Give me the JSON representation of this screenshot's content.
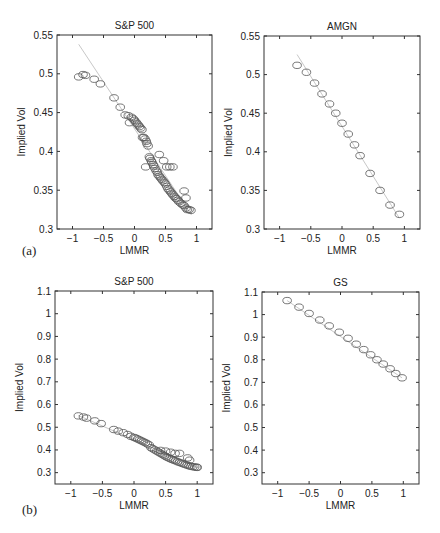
{
  "figure": {
    "panel_labels": [
      "(a)",
      "(b)"
    ]
  },
  "chart_data": [
    {
      "type": "scatter",
      "panel": "a",
      "title": "S&P 500",
      "xlabel": "LMMR",
      "ylabel": "Implied Vol",
      "xlim": [
        -1.25,
        1.25
      ],
      "ylim": [
        0.3,
        0.55
      ],
      "xticks": [
        -1,
        -0.5,
        0,
        0.5,
        1
      ],
      "xticklabels": [
        "-1",
        "-0.5",
        "0",
        "0.5",
        "1"
      ],
      "yticks": [
        0.3,
        0.35,
        0.4,
        0.45,
        0.5,
        0.55
      ],
      "yticklabels": [
        "0.3",
        "0.35",
        "0.4",
        "0.45",
        "0.5",
        "0.55"
      ],
      "grid": false,
      "fit_line": {
        "x": [
          -0.9,
          0.92
        ],
        "y": [
          0.538,
          0.318
        ]
      },
      "series": [
        {
          "name": "observed",
          "marker": "open-circle",
          "x": [
            -0.9,
            -0.83,
            -0.79,
            -0.65,
            -0.55,
            -0.33,
            -0.23,
            -0.15,
            -0.1,
            -0.08,
            -0.05,
            -0.02,
            0.0,
            0.02,
            0.04,
            0.06,
            0.08,
            0.1,
            0.12,
            0.13,
            0.15,
            0.17,
            0.19,
            0.2,
            0.22,
            0.24,
            0.25,
            0.27,
            0.28,
            0.3,
            0.31,
            0.33,
            0.35,
            0.37,
            0.38,
            0.4,
            0.42,
            0.44,
            0.46,
            0.48,
            0.5,
            0.52,
            0.54,
            0.56,
            0.58,
            0.6,
            0.62,
            0.64,
            0.66,
            0.68,
            0.7,
            0.72,
            0.75,
            0.78,
            0.8,
            0.83,
            0.85,
            0.88,
            0.91,
            0.18,
            0.4,
            0.47,
            0.52,
            0.57,
            0.62,
            0.8,
            0.83
          ],
          "y": [
            0.496,
            0.499,
            0.498,
            0.493,
            0.487,
            0.469,
            0.457,
            0.447,
            0.446,
            0.437,
            0.444,
            0.442,
            0.44,
            0.438,
            0.436,
            0.434,
            0.432,
            0.43,
            0.428,
            0.418,
            0.418,
            0.416,
            0.413,
            0.41,
            0.407,
            0.393,
            0.391,
            0.388,
            0.386,
            0.383,
            0.381,
            0.378,
            0.375,
            0.373,
            0.37,
            0.368,
            0.366,
            0.364,
            0.362,
            0.36,
            0.358,
            0.355,
            0.352,
            0.35,
            0.348,
            0.346,
            0.344,
            0.342,
            0.34,
            0.339,
            0.337,
            0.335,
            0.333,
            0.331,
            0.33,
            0.327,
            0.325,
            0.325,
            0.324,
            0.38,
            0.396,
            0.388,
            0.38,
            0.38,
            0.38,
            0.349,
            0.34
          ]
        }
      ]
    },
    {
      "type": "scatter",
      "panel": "a",
      "title": "AMGN",
      "xlabel": "LMMR",
      "ylabel": "Implied Vol",
      "xlim": [
        -1.25,
        1.25
      ],
      "ylim": [
        0.3,
        0.55
      ],
      "xticks": [
        -1,
        -0.5,
        0,
        0.5,
        1
      ],
      "xticklabels": [
        "-1",
        "-0.5",
        "0",
        "0.5",
        "1"
      ],
      "yticks": [
        0.3,
        0.35,
        0.4,
        0.45,
        0.5,
        0.55
      ],
      "yticklabels": [
        "0.3",
        "0.35",
        "0.4",
        "0.45",
        "0.5",
        "0.55"
      ],
      "grid": false,
      "fit_line": {
        "x": [
          -0.72,
          0.92
        ],
        "y": [
          0.526,
          0.314
        ]
      },
      "series": [
        {
          "name": "observed",
          "marker": "open-circle",
          "x": [
            -0.72,
            -0.57,
            -0.44,
            -0.32,
            -0.2,
            -0.1,
            0.0,
            0.1,
            0.2,
            0.29,
            0.45,
            0.61,
            0.77,
            0.92
          ],
          "y": [
            0.512,
            0.503,
            0.489,
            0.475,
            0.462,
            0.45,
            0.437,
            0.423,
            0.409,
            0.395,
            0.372,
            0.35,
            0.331,
            0.319
          ]
        }
      ]
    },
    {
      "type": "scatter",
      "panel": "b",
      "title": "S&P 500",
      "xlabel": "LMMR",
      "ylabel": "Implied Vol",
      "xlim": [
        -1.25,
        1.25
      ],
      "ylim": [
        0.25,
        1.1
      ],
      "xticks": [
        -1,
        -0.5,
        0,
        0.5,
        1
      ],
      "xticklabels": [
        "-1",
        "-0.5",
        "0",
        "0.5",
        "1"
      ],
      "yticks": [
        0.3,
        0.4,
        0.5,
        0.6,
        0.7,
        0.8,
        0.9,
        1.0,
        1.1
      ],
      "yticklabels": [
        "0.3",
        "0.4",
        "0.5",
        "0.6",
        "0.7",
        "0.8",
        "0.9",
        "1",
        "1.1"
      ],
      "grid": false,
      "fit_line": {
        "x": [
          -0.88,
          1.02
        ],
        "y": [
          0.552,
          0.32
        ]
      },
      "series": [
        {
          "name": "observed",
          "marker": "open-circle",
          "x": [
            -0.88,
            -0.8,
            -0.75,
            -0.62,
            -0.52,
            -0.32,
            -0.25,
            -0.17,
            -0.1,
            -0.05,
            0.0,
            0.03,
            0.06,
            0.09,
            0.12,
            0.15,
            0.18,
            0.21,
            0.24,
            0.27,
            0.3,
            0.33,
            0.36,
            0.39,
            0.42,
            0.45,
            0.48,
            0.51,
            0.54,
            0.57,
            0.6,
            0.63,
            0.66,
            0.69,
            0.72,
            0.75,
            0.78,
            0.81,
            0.84,
            0.87,
            0.9,
            0.93,
            0.96,
            0.99,
            1.0,
            0.42,
            0.5,
            0.58,
            0.65,
            0.72,
            0.85,
            0.88
          ],
          "y": [
            0.55,
            0.545,
            0.54,
            0.528,
            0.516,
            0.49,
            0.483,
            0.476,
            0.468,
            0.46,
            0.455,
            0.452,
            0.448,
            0.444,
            0.44,
            0.436,
            0.432,
            0.427,
            0.422,
            0.41,
            0.405,
            0.4,
            0.395,
            0.39,
            0.385,
            0.38,
            0.375,
            0.37,
            0.366,
            0.362,
            0.358,
            0.355,
            0.352,
            0.348,
            0.345,
            0.342,
            0.339,
            0.336,
            0.333,
            0.33,
            0.328,
            0.326,
            0.325,
            0.324,
            0.323,
            0.398,
            0.395,
            0.39,
            0.385,
            0.385,
            0.365,
            0.355
          ]
        }
      ]
    },
    {
      "type": "scatter",
      "panel": "b",
      "title": "GS",
      "xlabel": "LMMR",
      "ylabel": "Implied Vol",
      "xlim": [
        -1.25,
        1.25
      ],
      "ylim": [
        0.25,
        1.1
      ],
      "xticks": [
        -1,
        -0.5,
        0,
        0.5,
        1
      ],
      "xticklabels": [
        "-1",
        "-0.5",
        "0",
        "0.5",
        "1"
      ],
      "yticks": [
        0.3,
        0.4,
        0.5,
        0.6,
        0.7,
        0.8,
        0.9,
        1.0,
        1.1
      ],
      "yticklabels": [
        "0.3",
        "0.4",
        "0.5",
        "0.6",
        "0.7",
        "0.8",
        "0.9",
        "1",
        "1.1"
      ],
      "grid": false,
      "fit_line": {
        "x": [
          -0.85,
          0.98
        ],
        "y": [
          1.062,
          0.72
        ]
      },
      "series": [
        {
          "name": "observed",
          "marker": "open-circle",
          "x": [
            -0.85,
            -0.66,
            -0.5,
            -0.33,
            -0.18,
            -0.02,
            0.12,
            0.25,
            0.37,
            0.48,
            0.58,
            0.68,
            0.79,
            0.88,
            0.98
          ],
          "y": [
            1.062,
            1.033,
            1.005,
            0.976,
            0.95,
            0.922,
            0.895,
            0.869,
            0.845,
            0.822,
            0.8,
            0.781,
            0.76,
            0.739,
            0.72
          ]
        }
      ]
    }
  ]
}
